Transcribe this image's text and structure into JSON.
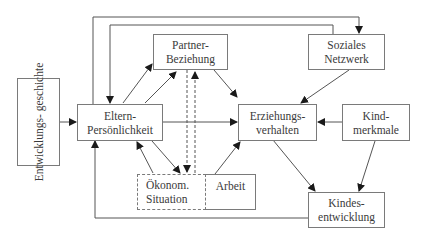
{
  "diagram": {
    "type": "influence-model",
    "colors": {
      "line": "#555555",
      "box_border": "#7a7a7a",
      "text": "#3a3a3a",
      "background": "#ffffff"
    },
    "nodes": {
      "entwicklungsgeschichte": {
        "lines": [
          "Entwicklungs-",
          "geschichte"
        ],
        "orientation": "vertical"
      },
      "eltern_persoenlichkeit": {
        "lines": [
          "Eltern-",
          "Persönlichkeit"
        ]
      },
      "partner_beziehung": {
        "lines": [
          "Partner-",
          "Beziehung"
        ]
      },
      "soziales_netzwerk": {
        "lines": [
          "Soziales",
          "Netzwerk"
        ]
      },
      "erziehungsverhalten": {
        "lines": [
          "Erziehungs-",
          "verhalten"
        ]
      },
      "kindmerkmale": {
        "lines": [
          "Kind-",
          "merkmale"
        ]
      },
      "oekonom_situation": {
        "lines": [
          "Ökonom.",
          "Situation"
        ],
        "style": "dashed"
      },
      "arbeit": {
        "lines": [
          "Arbeit"
        ]
      },
      "kindesentwicklung": {
        "lines": [
          "Kindes-",
          "entwicklung"
        ]
      }
    },
    "edges": [
      {
        "from": "Entwicklungsgeschichte",
        "to": "Eltern-Persönlichkeit"
      },
      {
        "from": "Eltern-Persönlichkeit",
        "to": "Partner-Beziehung"
      },
      {
        "from": "Partner-Beziehung",
        "to": "Eltern-Persönlichkeit"
      },
      {
        "from": "Eltern-Persönlichkeit",
        "to": "Erziehungsverhalten"
      },
      {
        "from": "Partner-Beziehung",
        "to": "Erziehungsverhalten"
      },
      {
        "from": "Soziales Netzwerk",
        "to": "Erziehungsverhalten"
      },
      {
        "from": "Kindmerkmale",
        "to": "Erziehungsverhalten"
      },
      {
        "from": "Kindmerkmale",
        "to": "Kindesentwicklung"
      },
      {
        "from": "Erziehungsverhalten",
        "to": "Kindesentwicklung"
      },
      {
        "from": "Eltern-Persönlichkeit",
        "to": "Ökonom. Situation"
      },
      {
        "from": "Ökonom. Situation",
        "to": "Eltern-Persönlichkeit"
      },
      {
        "from": "Partner-Beziehung",
        "to": "Ökonom. Situation",
        "style": "dashed"
      },
      {
        "from": "Ökonom. Situation",
        "to": "Partner-Beziehung",
        "style": "dashed"
      },
      {
        "from": "Arbeit",
        "to": "Erziehungsverhalten"
      },
      {
        "from": "Eltern-Persönlichkeit",
        "to": "Soziales Netzwerk",
        "route": "top-outer"
      },
      {
        "from": "Soziales Netzwerk",
        "to": "Eltern-Persönlichkeit",
        "route": "top-inner"
      },
      {
        "from": "Kindesentwicklung",
        "to": "Eltern-Persönlichkeit",
        "route": "bottom"
      }
    ]
  }
}
